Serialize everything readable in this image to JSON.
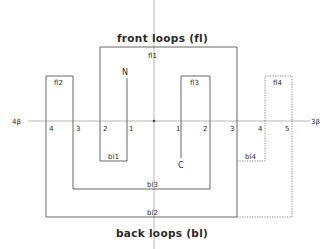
{
  "titles": {
    "front": "front loops (fl)",
    "back": "back loops (bl)"
  },
  "axis": {
    "left_label": "4β",
    "right_label": "3β"
  },
  "termini": {
    "n": "N",
    "c": "C"
  },
  "front_loops": {
    "fl1": "fl1",
    "fl2": "fl2",
    "fl3": "fl3",
    "fl4": "fl4"
  },
  "back_loops": {
    "bl1": "bl1",
    "bl2": "bl2",
    "bl3": "bl3",
    "bl4": "bl4"
  },
  "strand_numbers": {
    "left": [
      "4",
      "3",
      "2",
      "1"
    ],
    "right": [
      "1",
      "2",
      "3",
      "4",
      "5"
    ]
  },
  "colors": {
    "line": "#555555",
    "axis": "#9a9a9a",
    "text": "#2a2a2a"
  }
}
